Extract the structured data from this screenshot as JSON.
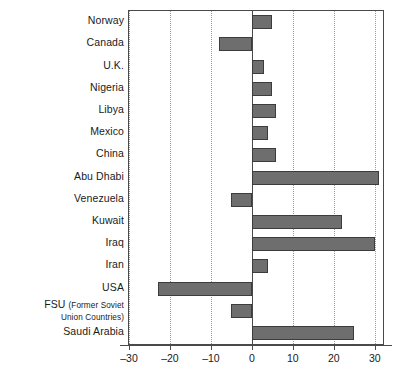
{
  "chart_data": {
    "type": "bar",
    "orientation": "horizontal",
    "title": "",
    "subtitle": "",
    "xlabel": "",
    "ylabel": "",
    "xlim": [
      -30,
      32
    ],
    "ylim": null,
    "grid": true,
    "grid_axis": "x",
    "legend": null,
    "legend_position": "none",
    "xticks": [
      -30,
      -20,
      -10,
      0,
      10,
      20,
      30
    ],
    "xtick_labels": [
      "–30",
      "–20",
      "–10",
      "0",
      "10",
      "20",
      "30"
    ],
    "bar_color": "#6e6e6e",
    "bar_edge_color": "#3c3c3c",
    "categories": [
      "Norway",
      "Canada",
      "U.K.",
      "Nigeria",
      "Libya",
      "Mexico",
      "China",
      "Abu Dhabi",
      "Venezuela",
      "Kuwait",
      "Iraq",
      "Iran",
      "USA",
      "FSU (Former Soviet Union Countries)",
      "Saudi Arabia"
    ],
    "values": [
      5,
      -8,
      3,
      5,
      6,
      4,
      6,
      31,
      -5,
      22,
      30,
      4,
      -23,
      -5,
      25
    ],
    "series": [
      {
        "name": "",
        "values": [
          5,
          -8,
          3,
          5,
          6,
          4,
          6,
          31,
          -5,
          22,
          30,
          4,
          -23,
          -5,
          25
        ]
      }
    ],
    "annotations": []
  },
  "labels": {
    "rows": [
      {
        "text": "Norway",
        "two_line": false
      },
      {
        "text": "Canada",
        "two_line": false
      },
      {
        "text": "U.K.",
        "two_line": false
      },
      {
        "text": "Nigeria",
        "two_line": false
      },
      {
        "text": "Libya",
        "two_line": false
      },
      {
        "text": "Mexico",
        "two_line": false
      },
      {
        "text": "China",
        "two_line": false
      },
      {
        "text": "Abu Dhabi",
        "two_line": false
      },
      {
        "text": "Venezuela",
        "two_line": false
      },
      {
        "text": "Kuwait",
        "two_line": false
      },
      {
        "text": "Iraq",
        "two_line": false
      },
      {
        "text": "Iran",
        "two_line": false
      },
      {
        "text": "USA",
        "two_line": false
      },
      {
        "text": "FSU (Former Soviet Union Countries)",
        "two_line": true,
        "line1_main": "FSU ",
        "line1_sub": "(Former Soviet",
        "line2_sub": "Union Countries)"
      },
      {
        "text": "Saudi Arabia",
        "two_line": false
      }
    ]
  }
}
